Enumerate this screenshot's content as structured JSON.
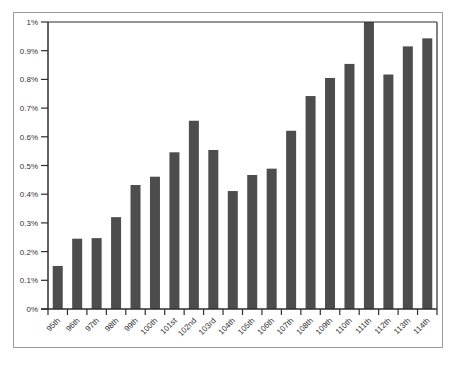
{
  "chart_data": {
    "type": "bar",
    "title": "",
    "xlabel": "",
    "ylabel": "",
    "categories": [
      "95th",
      "96th",
      "97th",
      "98th",
      "99th",
      "100th",
      "101st",
      "102nd",
      "103rd",
      "104th",
      "105th",
      "106th",
      "107th",
      "108th",
      "109th",
      "110th",
      "111th",
      "112th",
      "113th",
      "114th"
    ],
    "values": [
      0.15,
      0.245,
      0.247,
      0.32,
      0.432,
      0.461,
      0.546,
      0.656,
      0.554,
      0.411,
      0.467,
      0.489,
      0.621,
      0.742,
      0.805,
      0.854,
      1.0,
      0.817,
      0.915,
      0.943
    ],
    "value_unit": "%",
    "ylim": [
      0,
      1
    ],
    "yticks": [
      0,
      0.1,
      0.2,
      0.3,
      0.4,
      0.5,
      0.6,
      0.7,
      0.8,
      0.9,
      1
    ],
    "ytick_labels": [
      "0%",
      "0.1%",
      "0.2%",
      "0.3%",
      "0.4%",
      "0.5%",
      "0.6%",
      "0.7%",
      "0.8%",
      "0.9%",
      "1%"
    ],
    "grid": false,
    "legend": null,
    "colors": {
      "bar": "#4d4d4d",
      "axis": "#2e2e2e",
      "frame": "#9a9a9a",
      "text": "#333333"
    }
  }
}
